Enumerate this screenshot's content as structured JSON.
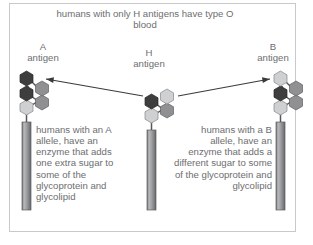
{
  "figure": {
    "caption_top": "humans with only H antigens have type O blood",
    "border_color": "#c8c9cb",
    "background": "#ffffff",
    "text_color": "#6d6e70"
  },
  "labels": {
    "a_antigen": "A\nantigen",
    "h_antigen": "H\nantigen",
    "b_antigen": "B\nantigen"
  },
  "paragraphs": {
    "a_allele": "humans with an A allele, have an enzyme that adds one extra sugar to some of the glycoprotein and glycolipid",
    "b_allele": "humans with a B allele, have an enzyme that adds a different sugar to some of the glycoprotein and glycolipid"
  },
  "structures": {
    "a_antigen": {
      "name": "A antigen glycan",
      "sugar_count": 5,
      "terminal_sugar_shade": "dark",
      "stem": "membrane glycoprotein/glycolipid stem"
    },
    "h_antigen": {
      "name": "H antigen glycan",
      "sugar_count": 4,
      "terminal_sugar_shade": "none",
      "stem": "membrane glycoprotein/glycolipid stem"
    },
    "b_antigen": {
      "name": "B antigen glycan",
      "sugar_count": 5,
      "terminal_sugar_shade": "light",
      "stem": "membrane glycoprotein/glycolipid stem"
    }
  },
  "arrows": {
    "h_to_a": "H antigen converted to A antigen",
    "h_to_b": "H antigen converted to B antigen"
  },
  "colors": {
    "sugar_dark": "#3e3e3e",
    "sugar_medium": "#8f9092",
    "sugar_light": "#cfd0d2",
    "stem": "#9a9b9d",
    "bond": "#55565a",
    "arrow": "#3a3a3a"
  }
}
